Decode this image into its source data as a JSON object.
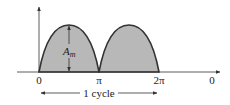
{
  "diagram": {
    "type": "full-wave rectified sine waveform",
    "colors": {
      "fill": "#b8b8b8",
      "stroke": "#333333",
      "axis": "#333333",
      "text": "#222222"
    },
    "amplitude_label": "A",
    "amplitude_subscript": "m",
    "x_ticks": [
      {
        "label": "0"
      },
      {
        "label": "π"
      },
      {
        "label": "2π"
      },
      {
        "label": "0"
      }
    ],
    "period_label": "1 cycle"
  }
}
